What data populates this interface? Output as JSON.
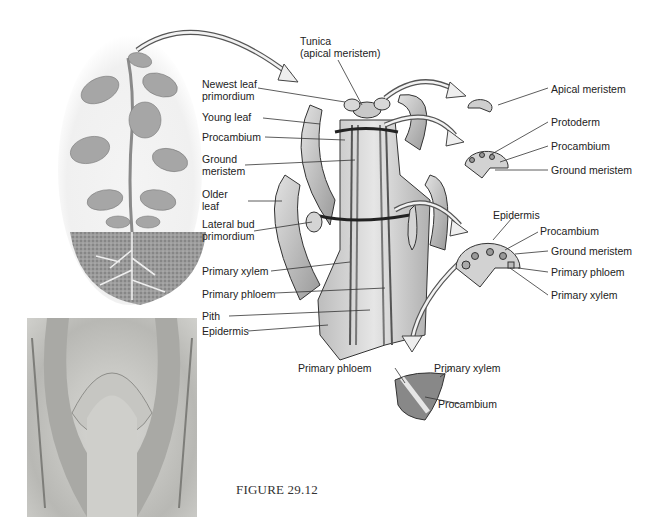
{
  "figure": {
    "caption": "FIGURE 29.12"
  },
  "shoot_labels": {
    "tunica_line1": "Tunica",
    "tunica_line2": "(apical  meristem)",
    "newest_leaf_1": "Newest leaf",
    "newest_leaf_2": "primordium",
    "young_leaf": "Young leaf",
    "procambium": "Procambium",
    "ground_meristem_1": "Ground",
    "ground_meristem_2": "meristem",
    "older_leaf_1": "Older",
    "older_leaf_2": "leaf",
    "lateral_bud_1": "Lateral bud",
    "lateral_bud_2": "primordium",
    "primary_xylem": "Primary xylem",
    "primary_phloem": "Primary phloem",
    "pith": "Pith",
    "epidermis": "Epidermis"
  },
  "section1_labels": {
    "apical_meristem": "Apical meristem"
  },
  "section2_labels": {
    "protoderm": "Protoderm",
    "procambium": "Procambium",
    "ground_meristem": "Ground meristem"
  },
  "section3_labels": {
    "epidermis": "Epidermis",
    "procambium": "Procambium",
    "ground_meristem": "Ground meristem",
    "primary_phloem": "Primary phloem",
    "primary_xylem": "Primary xylem"
  },
  "bundle_labels": {
    "primary_phloem": "Primary phloem",
    "primary_xylem": "Primary xylem",
    "procambium": "Procambium"
  },
  "colors": {
    "line": "#333333",
    "tissue_light": "#d6d6d6",
    "tissue_mid": "#a8a8a8",
    "tissue_dark": "#6e6e6e"
  }
}
